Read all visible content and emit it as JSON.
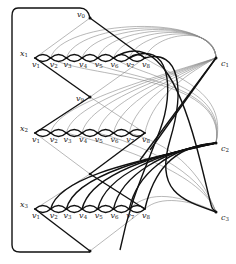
{
  "diagram": {
    "type": "graph-reduction-gadget",
    "colors": {
      "thick_edge": "#111111",
      "thin_edge": "#777777",
      "node": "#111111",
      "background": "#ffffff"
    },
    "variable_gadgets": [
      {
        "id": "x1",
        "label": "x",
        "sub": "1",
        "y": 58,
        "vertices": [
          "v1",
          "v2",
          "v3",
          "v4",
          "v5",
          "v6",
          "v7",
          "v8"
        ]
      },
      {
        "id": "x2",
        "label": "x",
        "sub": "2",
        "y": 133,
        "vertices": [
          "v1",
          "v2",
          "v3",
          "v4",
          "v5",
          "v6",
          "v7",
          "v8"
        ]
      },
      {
        "id": "x3",
        "label": "x",
        "sub": "3",
        "y": 209,
        "vertices": [
          "v1",
          "v2",
          "v3",
          "v4",
          "v5",
          "v6",
          "v7",
          "v8"
        ]
      }
    ],
    "vertex_labels": [
      {
        "label": "v",
        "sub": "1"
      },
      {
        "label": "v",
        "sub": "2"
      },
      {
        "label": "v",
        "sub": "3"
      },
      {
        "label": "v",
        "sub": "4"
      },
      {
        "label": "v",
        "sub": "5"
      },
      {
        "label": "v",
        "sub": "6"
      },
      {
        "label": "v",
        "sub": "7"
      },
      {
        "label": "v",
        "sub": "8"
      }
    ],
    "connector_nodes": [
      {
        "id": "v0",
        "label": "v",
        "sub": "0",
        "x": 90,
        "y": 18
      },
      {
        "id": "v9",
        "label": "v",
        "sub": "9",
        "x": 90,
        "y": 97
      },
      {
        "id": "bottom",
        "label": "",
        "sub": "",
        "x": 90,
        "y": 251
      }
    ],
    "clause_nodes": [
      {
        "id": "c1",
        "label": "c",
        "sub": "1",
        "x": 216,
        "y": 58
      },
      {
        "id": "c2",
        "label": "c",
        "sub": "2",
        "x": 216,
        "y": 143
      },
      {
        "id": "c3",
        "label": "c",
        "sub": "3",
        "x": 216,
        "y": 212
      }
    ]
  }
}
